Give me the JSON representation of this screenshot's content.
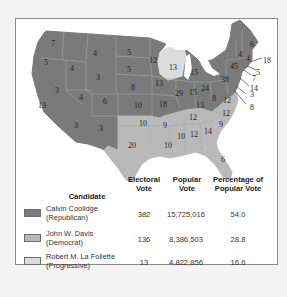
{
  "map": {
    "title": "1924 Presidential Election Results",
    "colors": {
      "republican": "#7a7a7a",
      "democrat": "#b9b9b9",
      "progressive": "#dcdcdc",
      "state_border": "#a8a8a8",
      "water": "#ffffff"
    },
    "state_labels": [
      {
        "state": "Washington",
        "votes": "7",
        "party": "republican"
      },
      {
        "state": "Oregon",
        "votes": "5",
        "party": "republican"
      },
      {
        "state": "California",
        "votes": "13",
        "party": "republican"
      },
      {
        "state": "Idaho",
        "votes": "4",
        "party": "republican"
      },
      {
        "state": "Nevada",
        "votes": "3",
        "party": "republican"
      },
      {
        "state": "Montana",
        "votes": "4",
        "party": "republican"
      },
      {
        "state": "Wyoming",
        "votes": "3",
        "party": "republican"
      },
      {
        "state": "Utah",
        "votes": "4",
        "party": "republican"
      },
      {
        "state": "Arizona",
        "votes": "3",
        "party": "republican"
      },
      {
        "state": "Colorado",
        "votes": "6",
        "party": "republican"
      },
      {
        "state": "New Mexico",
        "votes": "3",
        "party": "republican"
      },
      {
        "state": "North Dakota",
        "votes": "5",
        "party": "republican"
      },
      {
        "state": "South Dakota",
        "votes": "5",
        "party": "republican"
      },
      {
        "state": "Nebraska",
        "votes": "8",
        "party": "republican"
      },
      {
        "state": "Kansas",
        "votes": "10",
        "party": "republican"
      },
      {
        "state": "Oklahoma",
        "votes": "10",
        "party": "democrat"
      },
      {
        "state": "Texas",
        "votes": "20",
        "party": "democrat"
      },
      {
        "state": "Minnesota",
        "votes": "12",
        "party": "republican"
      },
      {
        "state": "Iowa",
        "votes": "13",
        "party": "republican"
      },
      {
        "state": "Missouri",
        "votes": "18",
        "party": "republican"
      },
      {
        "state": "Arkansas",
        "votes": "9",
        "party": "democrat"
      },
      {
        "state": "Louisiana",
        "votes": "10",
        "party": "democrat"
      },
      {
        "state": "Wisconsin",
        "votes": "13",
        "party": "progressive"
      },
      {
        "state": "Illinois",
        "votes": "29",
        "party": "republican"
      },
      {
        "state": "Michigan",
        "votes": "15",
        "party": "republican"
      },
      {
        "state": "Indiana",
        "votes": "15",
        "party": "republican"
      },
      {
        "state": "Ohio",
        "votes": "24",
        "party": "republican"
      },
      {
        "state": "Kentucky",
        "votes": "13",
        "party": "republican"
      },
      {
        "state": "Tennessee",
        "votes": "12",
        "party": "democrat"
      },
      {
        "state": "Mississippi",
        "votes": "10",
        "party": "democrat"
      },
      {
        "state": "Alabama",
        "votes": "12",
        "party": "democrat"
      },
      {
        "state": "Georgia",
        "votes": "14",
        "party": "democrat"
      },
      {
        "state": "Florida",
        "votes": "6",
        "party": "democrat"
      },
      {
        "state": "South Carolina",
        "votes": "9",
        "party": "democrat"
      },
      {
        "state": "North Carolina",
        "votes": "12",
        "party": "democrat"
      },
      {
        "state": "Virginia",
        "votes": "12",
        "party": "democrat"
      },
      {
        "state": "West Virginia",
        "votes": "8",
        "party": "republican"
      },
      {
        "state": "Pennsylvania",
        "votes": "38",
        "party": "republican"
      },
      {
        "state": "New York",
        "votes": "45",
        "party": "republican"
      },
      {
        "state": "Vermont",
        "votes": "4",
        "party": "republican"
      },
      {
        "state": "New Hampshire",
        "votes": "4",
        "party": "republican"
      },
      {
        "state": "Maine",
        "votes": "6",
        "party": "republican"
      },
      {
        "state": "Massachusetts",
        "votes": "18",
        "party": "republican"
      },
      {
        "state": "Rhode Island",
        "votes": "5",
        "party": "republican"
      },
      {
        "state": "Connecticut",
        "votes": "7",
        "party": "republican"
      },
      {
        "state": "New Jersey",
        "votes": "14",
        "party": "republican"
      },
      {
        "state": "Delaware",
        "votes": "3",
        "party": "republican"
      },
      {
        "state": "Maryland",
        "votes": "8",
        "party": "republican"
      }
    ]
  },
  "legend": {
    "headers": {
      "candidate": "Candidate",
      "electoral_1": "Electoral",
      "electoral_2": "Vote",
      "popular_1": "Popular",
      "popular_2": "Vote",
      "percent_1": "Percentage of",
      "percent_2": "Popular Vote"
    },
    "rows": [
      {
        "name": "Calvin Coolidge",
        "party": "(Republican)",
        "electoral": "382",
        "popular": "15,725,016",
        "percent": "54.0",
        "color": "#7a7a7a"
      },
      {
        "name": "John W. Davis",
        "party": "(Democrat)",
        "electoral": "136",
        "popular": "8,386,503",
        "percent": "28.8",
        "color": "#b9b9b9"
      },
      {
        "name": "Robert M. La Follette",
        "party": "(Progressive)",
        "electoral": "13",
        "popular": "4,822,856",
        "percent": "16.6",
        "color": "#dcdcdc"
      }
    ]
  }
}
